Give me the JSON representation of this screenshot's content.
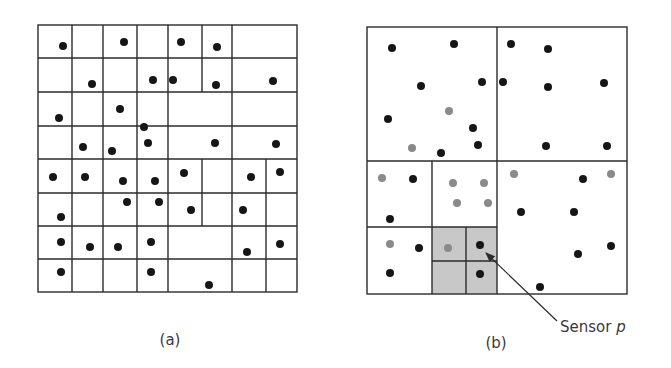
{
  "colors": {
    "line": "#2b2b2b",
    "dot_black": "#161616",
    "dot_grey": "#8a8a8a",
    "shade": "#c8c8c8",
    "text": "#3a3a3a"
  },
  "panel_a": {
    "label": "(a)",
    "frame": {
      "x1": 38,
      "y1": 25,
      "x2": 297,
      "y2": 292
    },
    "rows": [
      {
        "y1": 25,
        "y2": 58,
        "vlines": [
          72,
          103,
          137,
          168,
          202,
          232
        ]
      },
      {
        "y1": 58,
        "y2": 92,
        "vlines": [
          72,
          103,
          137,
          168,
          202,
          232
        ]
      },
      {
        "y1": 92,
        "y2": 126,
        "vlines": [
          72,
          103,
          137,
          168,
          232
        ]
      },
      {
        "y1": 126,
        "y2": 159,
        "vlines": [
          72,
          103,
          137,
          168,
          232
        ]
      },
      {
        "y1": 159,
        "y2": 193,
        "vlines": [
          72,
          103,
          137,
          168,
          202,
          232,
          266
        ]
      },
      {
        "y1": 193,
        "y2": 226,
        "vlines": [
          72,
          103,
          137,
          168,
          202,
          232,
          266
        ]
      },
      {
        "y1": 226,
        "y2": 259,
        "vlines": [
          72,
          103,
          137,
          168,
          232,
          266
        ]
      },
      {
        "y1": 259,
        "y2": 292,
        "vlines": [
          72,
          103,
          137,
          168,
          232,
          266
        ]
      }
    ],
    "dots": [
      [
        63,
        46
      ],
      [
        124,
        42
      ],
      [
        181,
        42
      ],
      [
        217,
        47
      ],
      [
        92,
        84
      ],
      [
        153,
        80
      ],
      [
        173,
        80
      ],
      [
        216,
        85
      ],
      [
        273,
        81
      ],
      [
        59,
        118
      ],
      [
        120,
        109
      ],
      [
        144,
        127
      ],
      [
        83,
        147
      ],
      [
        112,
        151
      ],
      [
        148,
        143
      ],
      [
        215,
        143
      ],
      [
        276,
        144
      ],
      [
        53,
        177
      ],
      [
        85,
        177
      ],
      [
        123,
        181
      ],
      [
        155,
        181
      ],
      [
        184,
        173
      ],
      [
        251,
        177
      ],
      [
        280,
        172
      ],
      [
        127,
        202
      ],
      [
        159,
        202
      ],
      [
        191,
        210
      ],
      [
        243,
        210
      ],
      [
        61,
        217
      ],
      [
        61,
        242
      ],
      [
        90,
        247
      ],
      [
        118,
        247
      ],
      [
        151,
        242
      ],
      [
        247,
        252
      ],
      [
        280,
        244
      ],
      [
        61,
        272
      ],
      [
        151,
        272
      ],
      [
        209,
        285
      ]
    ]
  },
  "panel_b": {
    "label": "(b)",
    "annotation": "Sensor p",
    "annotation_prefix": "Sensor ",
    "annotation_var": "p",
    "frame": {
      "x1": 367,
      "y1": 27,
      "x2": 627,
      "y2": 294
    },
    "lines": [
      [
        497,
        27,
        497,
        294
      ],
      [
        367,
        161,
        627,
        161
      ],
      [
        432,
        161,
        432,
        294
      ],
      [
        367,
        227,
        497,
        227
      ],
      [
        466,
        227,
        466,
        294
      ],
      [
        432,
        261,
        497,
        261
      ]
    ],
    "shaded_region": {
      "x1": 432,
      "y1": 227,
      "x2": 497,
      "y2": 294
    },
    "black_dots": [
      [
        392,
        48
      ],
      [
        454,
        44
      ],
      [
        421,
        86
      ],
      [
        482,
        82
      ],
      [
        388,
        119
      ],
      [
        473,
        128
      ],
      [
        478,
        145
      ],
      [
        441,
        153
      ],
      [
        511,
        44
      ],
      [
        548,
        49
      ],
      [
        503,
        82
      ],
      [
        548,
        87
      ],
      [
        604,
        83
      ],
      [
        546,
        146
      ],
      [
        607,
        146
      ],
      [
        413,
        179
      ],
      [
        390,
        219
      ],
      [
        419,
        248
      ],
      [
        390,
        273
      ],
      [
        480,
        245
      ],
      [
        480,
        274
      ],
      [
        583,
        179
      ],
      [
        521,
        212
      ],
      [
        574,
        212
      ],
      [
        578,
        254
      ],
      [
        611,
        246
      ],
      [
        540,
        287
      ]
    ],
    "grey_dots": [
      [
        449,
        111
      ],
      [
        412,
        148
      ],
      [
        382,
        178
      ],
      [
        453,
        183
      ],
      [
        484,
        183
      ],
      [
        457,
        203
      ],
      [
        488,
        203
      ],
      [
        390,
        244
      ],
      [
        448,
        248
      ],
      [
        514,
        174
      ],
      [
        611,
        174
      ]
    ],
    "arrow": {
      "from": [
        557,
        321
      ],
      "to": [
        486,
        253
      ]
    }
  }
}
